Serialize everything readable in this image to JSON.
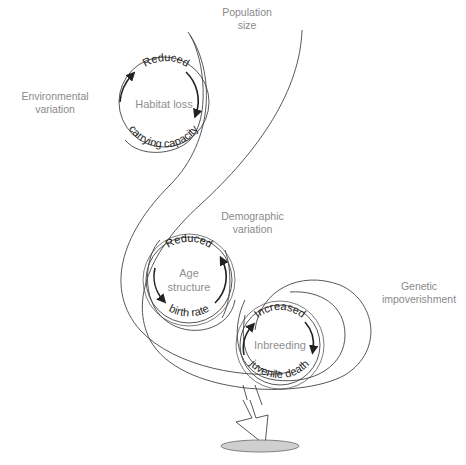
{
  "labels": {
    "population_size": [
      "Population",
      "size"
    ],
    "environmental_variation": [
      "Environmental",
      "variation"
    ],
    "demographic_variation": [
      "Demographic",
      "variation"
    ],
    "genetic_impoverishment": [
      "Genetic",
      "impoverishment"
    ]
  },
  "cycles": [
    {
      "id": "habitat",
      "center_text": "Habitat loss",
      "top_text": "Reduced",
      "bottom_text": "carrying capacity"
    },
    {
      "id": "age",
      "center_text_lines": [
        "Age",
        "structure"
      ],
      "top_text": "Reduced",
      "bottom_text": "birth rate"
    },
    {
      "id": "inbreeding",
      "center_text": "Inbreeding",
      "top_text": "Increased",
      "bottom_text": "juvenile death"
    }
  ],
  "colors": {
    "line": "#444444",
    "arrow": "#222222",
    "label": "#8a8a8a",
    "extinction_ellipse": "#cfcfcf"
  }
}
